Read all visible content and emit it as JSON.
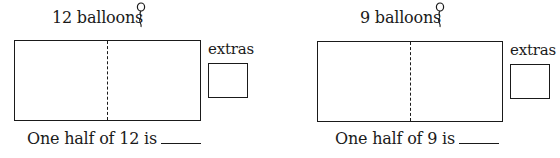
{
  "problems": [
    {
      "title": "12 balloons",
      "extras_label": "extras",
      "question": "One half of 12 is",
      "answer_blank": "",
      "icon": "balloon-icon"
    },
    {
      "title": "9 balloons",
      "extras_label": "extras",
      "question": "One half of 9 is",
      "answer_blank": "",
      "icon": "balloon-icon"
    }
  ]
}
